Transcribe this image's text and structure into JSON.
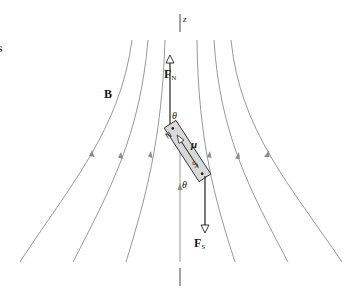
{
  "figure": {
    "edge_glyph": "s",
    "axis_label": "z",
    "field_label": "B",
    "moment_label": "μ",
    "angle_label_top": "θ",
    "angle_label_bottom": "θ",
    "force_north": {
      "symbol": "F",
      "subscript": "N"
    },
    "force_south": {
      "symbol": "F",
      "subscript": "S"
    },
    "magnet": {
      "north_label": "N",
      "south_label": "S"
    },
    "colors": {
      "field_line": "#8c8c8c",
      "axis": "#333333",
      "force_vector": "#222222",
      "magnet_fill": "#d9d9d9",
      "magnet_stroke": "#333333",
      "text": "#1a1a1a"
    }
  }
}
